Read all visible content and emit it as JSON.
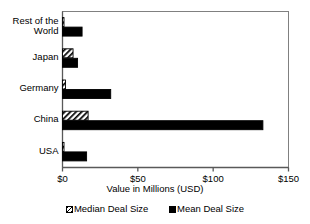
{
  "chart_data": {
    "type": "bar",
    "orientation": "horizontal",
    "title": "",
    "xlabel": "Value in Millions (USD)",
    "ylabel": "",
    "xlim": [
      0,
      150
    ],
    "xticks": [
      0,
      50,
      100,
      150
    ],
    "xtick_labels": [
      "$0",
      "$50",
      "$100",
      "$150"
    ],
    "grid": false,
    "legend_position": "bottom",
    "categories": [
      "Rest of the World",
      "Japan",
      "Germany",
      "China",
      "USA"
    ],
    "series": [
      {
        "name": "Median Deal Size",
        "pattern": "hatch",
        "color": "#000000",
        "values": [
          1,
          7,
          2,
          17,
          1
        ]
      },
      {
        "name": "Mean Deal Size",
        "pattern": "solid",
        "color": "#000000",
        "values": [
          13,
          10,
          32,
          133,
          16
        ]
      }
    ]
  },
  "axis": {
    "x_title": "Value in Millions (USD)",
    "tick_0": "$0",
    "tick_1": "$50",
    "tick_2": "$100",
    "tick_3": "$150"
  },
  "categories": {
    "c0": "Rest of the\nWorld",
    "c1": "Japan",
    "c2": "Germany",
    "c3": "China",
    "c4": "USA"
  },
  "legend": {
    "median_label": "Median Deal Size",
    "mean_label": "Mean Deal Size"
  }
}
